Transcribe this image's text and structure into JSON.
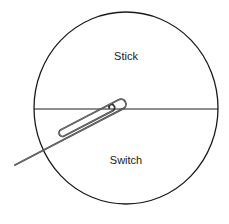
{
  "diagram": {
    "title": "",
    "regions": [
      {
        "id": "top",
        "label": "Stick"
      },
      {
        "id": "bottom",
        "label": "Switch"
      }
    ],
    "elements": {
      "circle": {
        "cx": 126,
        "cy": 108,
        "rx": 92,
        "ry": 96,
        "stroke": "#1a1a1a"
      },
      "divider": {
        "y": 109,
        "stroke": "#1a1a1a"
      },
      "paperclip": {
        "stroke": "#333333",
        "angle_deg": -27.5,
        "origin": [
          15,
          165
        ]
      }
    },
    "colors": {
      "background": "#ffffff",
      "line": "#1a1a1a",
      "paperclip": "#333333"
    }
  }
}
